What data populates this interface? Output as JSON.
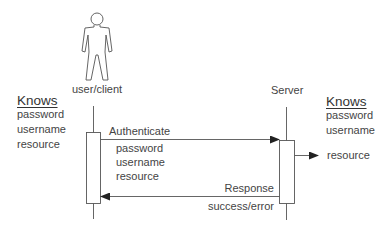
{
  "diagram": {
    "type": "sequence",
    "actors": [
      {
        "id": "client",
        "label": "user/client",
        "icon": "person-icon"
      },
      {
        "id": "server",
        "label": "Server"
      }
    ],
    "client_knows": {
      "title": "Knows",
      "items": [
        "password",
        "username",
        "resource"
      ]
    },
    "server_knows": {
      "title": "Knows",
      "items": [
        "password",
        "username"
      ]
    },
    "messages": [
      {
        "from": "client",
        "to": "server",
        "label": "Authenticate",
        "params": [
          "password",
          "username",
          "resource"
        ]
      },
      {
        "from": "server",
        "to": "client",
        "label": "Response",
        "detail": "success/error"
      }
    ],
    "server_output": {
      "label": "resource"
    },
    "colors": {
      "line": "#555555",
      "text": "#444444",
      "background": "#ffffff"
    }
  }
}
